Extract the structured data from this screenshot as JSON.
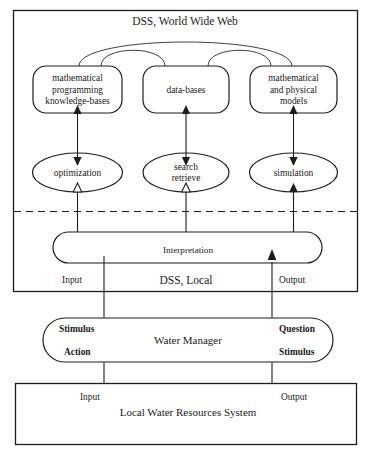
{
  "diagram": {
    "title": "DSS, World Wide Web",
    "layers": {
      "web_layer_label": "DSS, World Wide Web",
      "local_layer_label": "DSS, Local",
      "manager_label": "Water Manager",
      "system_label": "Local Water Resources System"
    },
    "knowledge_nodes": [
      {
        "id": "mathematical-programming-knowledge-bases",
        "lines": [
          "mathematical",
          "programming",
          "knowledge-bases"
        ]
      },
      {
        "id": "data-bases",
        "lines": [
          "data-bases"
        ]
      },
      {
        "id": "mathematical-and-physical-models",
        "lines": [
          "mathematical",
          "and physical",
          "models"
        ]
      }
    ],
    "process_nodes": [
      {
        "id": "optimization",
        "lines": [
          "optimization"
        ]
      },
      {
        "id": "search-retrieve",
        "lines": [
          "search",
          "retrieve"
        ]
      },
      {
        "id": "simulation",
        "lines": [
          "simulation"
        ]
      }
    ],
    "interpretation": {
      "label": "Interpretation"
    },
    "io_labels": {
      "dss_input": "Input",
      "dss_output": "Output",
      "system_input": "Input",
      "system_output": "Output"
    },
    "manager_ports": {
      "stimulus_in": "Stimulus",
      "action_out": "Action",
      "question_out": "Question",
      "stimulus_back": "Stimulus"
    },
    "colors": {
      "stroke": "#1d1d1d",
      "background": "#ffffff",
      "text": "#1a1a1a"
    }
  }
}
